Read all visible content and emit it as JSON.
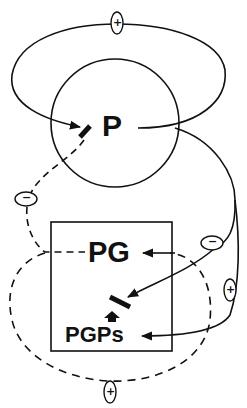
{
  "diagram": {
    "nodes": {
      "p": {
        "label": "P"
      },
      "pg": {
        "label": "PG"
      },
      "pgps": {
        "label": "PGPs"
      }
    },
    "signs": {
      "top_positive": "+",
      "left_negative": "−",
      "right_negative": "−",
      "right_positive": "+",
      "bottom_positive": "+"
    },
    "colors": {
      "ink": "#111111",
      "background": "#ffffff"
    }
  }
}
